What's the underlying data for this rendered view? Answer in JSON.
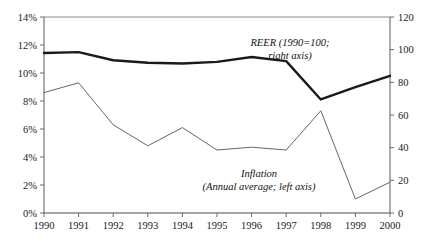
{
  "chart_data": {
    "type": "line",
    "title": "",
    "subtitle": "",
    "xlabel": "",
    "ylabel": "",
    "grid": false,
    "legend_position": "inline-annotation",
    "x": [
      1990,
      1991,
      1992,
      1993,
      1994,
      1995,
      1996,
      1997,
      1998,
      1999,
      2000
    ],
    "x_tick_labels": [
      "1990",
      "1991",
      "1992",
      "1993",
      "1994",
      "1995",
      "1996",
      "1997",
      "1998",
      "1999",
      "2000"
    ],
    "left_axis": {
      "label": "",
      "ylim": [
        0,
        14
      ],
      "ticks": [
        0,
        2,
        4,
        6,
        8,
        10,
        12,
        14
      ],
      "tick_labels": [
        "0%",
        "2%",
        "4%",
        "6%",
        "8%",
        "10%",
        "12%",
        "14%"
      ]
    },
    "right_axis": {
      "label": "",
      "ylim": [
        0,
        120
      ],
      "ticks": [
        0,
        20,
        40,
        60,
        80,
        100,
        120
      ],
      "tick_labels": [
        "0",
        "20",
        "40",
        "60",
        "80",
        "100",
        "120"
      ]
    },
    "series": [
      {
        "name": "REER (1990=100; right axis)",
        "axis": "right",
        "color": "#1a1a1a",
        "line_width": 2.4,
        "values": [
          98,
          98.5,
          93.5,
          92,
          91.5,
          92.5,
          95.5,
          93,
          69.5,
          77,
          84
        ]
      },
      {
        "name": "Inflation (Annual average; left axis)",
        "axis": "left",
        "color": "#555555",
        "line_width": 0.9,
        "values": [
          8.6,
          9.3,
          6.3,
          4.8,
          6.1,
          4.5,
          4.7,
          4.5,
          7.3,
          1.0,
          2.2
        ]
      }
    ],
    "annotations": [
      {
        "name": "reer-annotation",
        "lines": [
          "REER (1990=100;",
          "right axis)"
        ],
        "x_px": 290,
        "y_px": 46
      },
      {
        "name": "inflation-annotation",
        "lines": [
          "Inflation",
          "(Annual average; left axis)"
        ],
        "x_px": 259,
        "y_px": 177
      }
    ]
  }
}
